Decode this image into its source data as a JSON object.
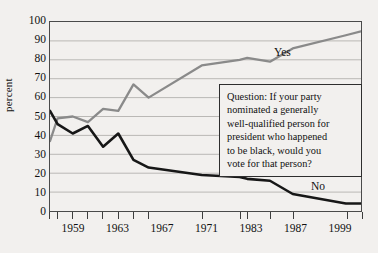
{
  "chart_data": {
    "type": "line",
    "title": "",
    "xlabel": "",
    "ylabel": "percent",
    "ylim": [
      0,
      100
    ],
    "ytick_values": [
      0,
      10,
      20,
      30,
      40,
      50,
      60,
      70,
      80,
      90,
      100
    ],
    "xtick_labels": [
      "1959",
      "1963",
      "1967",
      "1971",
      "1983",
      "1987",
      "1999"
    ],
    "grid": true,
    "legend_position": "inline-annotation",
    "annotation": "Question: If your party nominated a generally well-qualified person for president who happened to be black, would you vote for that person?",
    "annotation_lines": [
      "Question: If your party",
      "nominated a generally",
      "well-qualified person for",
      "president who happened",
      "to be black, would you",
      "vote for that person?"
    ],
    "x": [
      1958,
      1959,
      1961,
      1963,
      1965,
      1967,
      1969,
      1971,
      1978,
      1983,
      1984,
      1987,
      1990,
      1997,
      1999
    ],
    "series": [
      {
        "name": "Yes",
        "color": "#8a8a8a",
        "label_x": 1988,
        "label_y": 84,
        "values": [
          37,
          49,
          50,
          47,
          54,
          53,
          67,
          60,
          77,
          80,
          81,
          79,
          86,
          93,
          95
        ]
      },
      {
        "name": "No",
        "color": "#171717",
        "label_x": 1994,
        "label_y": 15,
        "values": [
          53,
          46,
          41,
          45,
          34,
          41,
          27,
          23,
          19,
          18,
          17,
          16,
          9,
          4,
          4
        ]
      }
    ]
  }
}
